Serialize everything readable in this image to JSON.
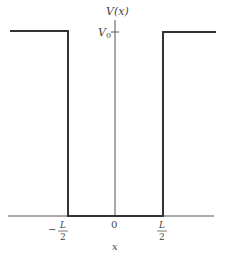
{
  "diagram": {
    "type": "finite square potential well",
    "y_axis_label": "V(x)",
    "x_axis_label": "x",
    "level_label": "V",
    "level_subscript": "0",
    "ticks": {
      "left_sign": "−",
      "left_num": "L",
      "left_den": "2",
      "center": "0",
      "right_num": "L",
      "right_den": "2"
    },
    "colors": {
      "line": "#333333",
      "axis": "#555555",
      "text": "#444444"
    }
  }
}
